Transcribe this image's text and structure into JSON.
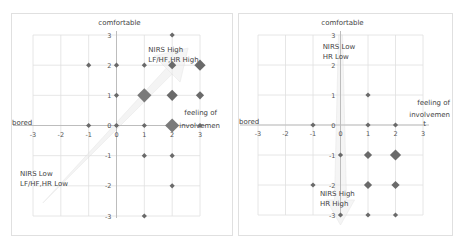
{
  "chart_data": [
    {
      "type": "scatter",
      "title": "",
      "xlabel": "feeling of involvemen t",
      "xlabel_negative": "bored",
      "ylabel": "comfortable",
      "xlim": [
        -3,
        3
      ],
      "ylim": [
        -3,
        3
      ],
      "x_ticks": [
        "-3",
        "-2",
        "-1",
        "0",
        "1",
        "2",
        "3"
      ],
      "y_ticks": [
        "3",
        "2",
        "1",
        "0",
        "-1",
        "-2",
        "-3"
      ],
      "grid": true,
      "annotations": [
        {
          "text": "NIRS High",
          "text2": "LF/HF,HR High",
          "region": "upper-right"
        },
        {
          "text": "NIRS Low",
          "text2": "LF/HF,HR Low",
          "region": "lower-left"
        }
      ],
      "trend_arrow": {
        "from": [
          -2.5,
          -2.5
        ],
        "to": [
          2.5,
          2.5
        ],
        "style": "faint wide arrow"
      },
      "points": [
        {
          "x": 2,
          "y": 3,
          "size": 1
        },
        {
          "x": -1,
          "y": 2,
          "size": 1
        },
        {
          "x": 0,
          "y": 2,
          "size": 1
        },
        {
          "x": 1,
          "y": 2,
          "size": 1
        },
        {
          "x": 2,
          "y": 2,
          "size": 2
        },
        {
          "x": 3,
          "y": 2,
          "size": 3
        },
        {
          "x": 0,
          "y": 1,
          "size": 1
        },
        {
          "x": 1,
          "y": 1,
          "size": 4
        },
        {
          "x": 2,
          "y": 1,
          "size": 3
        },
        {
          "x": 3,
          "y": 1,
          "size": 2
        },
        {
          "x": -1,
          "y": 0,
          "size": 1
        },
        {
          "x": 0,
          "y": 0,
          "size": 1
        },
        {
          "x": 1,
          "y": 0,
          "size": 1
        },
        {
          "x": 2,
          "y": 0,
          "size": 4
        },
        {
          "x": 3,
          "y": 0,
          "size": 1
        },
        {
          "x": 1,
          "y": -1,
          "size": 1
        },
        {
          "x": 2,
          "y": -1,
          "size": 1
        },
        {
          "x": 2,
          "y": -2,
          "size": 1
        },
        {
          "x": 1,
          "y": -3,
          "size": 1
        }
      ]
    },
    {
      "type": "scatter",
      "title": "",
      "xlabel": "feeling of involvemen t",
      "xlabel_negative": "bored",
      "ylabel": "comfortable",
      "xlim": [
        -3,
        3
      ],
      "ylim": [
        -3,
        3
      ],
      "x_ticks": [
        "-3",
        "-2",
        "-1",
        "0",
        "1",
        "2",
        "3"
      ],
      "y_ticks": [
        "3",
        "2",
        "1",
        "0",
        "-1",
        "-2",
        "-3"
      ],
      "grid": true,
      "annotations": [
        {
          "text": "NIRS Low",
          "text2": "HR Low",
          "region": "upper"
        },
        {
          "text": "NIRS High",
          "text2": "HR High",
          "region": "lower"
        }
      ],
      "trend_arrow": {
        "from": [
          0,
          3
        ],
        "to": [
          0,
          -3
        ],
        "style": "faint narrow arrow"
      },
      "points": [
        {
          "x": 1,
          "y": 1,
          "size": 1
        },
        {
          "x": -1,
          "y": 0,
          "size": 1
        },
        {
          "x": 1,
          "y": 0,
          "size": 1
        },
        {
          "x": 2,
          "y": 0,
          "size": 1
        },
        {
          "x": 0,
          "y": -1,
          "size": 1
        },
        {
          "x": 1,
          "y": -1,
          "size": 2
        },
        {
          "x": 2,
          "y": -1,
          "size": 3
        },
        {
          "x": -1,
          "y": -2,
          "size": 1
        },
        {
          "x": 1,
          "y": -2,
          "size": 2
        },
        {
          "x": 2,
          "y": -2,
          "size": 2
        },
        {
          "x": 0,
          "y": -3,
          "size": 1
        },
        {
          "x": 1,
          "y": -3,
          "size": 1
        },
        {
          "x": 2,
          "y": -3,
          "size": 1
        }
      ]
    }
  ],
  "colors": {
    "marker": "#6a6a6a",
    "grid": "#e0e0e0",
    "axis": "#bdbdbd",
    "text": "#444444",
    "arrow": "#d6d6d6"
  },
  "left": {
    "ylabel": "comfortable",
    "xlabel_pos_1": "feeling of",
    "xlabel_pos_2": "involvemen",
    "xlabel_neg": "bored",
    "ann_high_1": "NIRS High",
    "ann_high_2": "LF/HF,HR High",
    "ann_low_1": "NIRS Low",
    "ann_low_2": "LF/HF,HR Low"
  },
  "right": {
    "ylabel": "comfortable",
    "xlabel_pos_1": "feeling of",
    "xlabel_pos_2": "involvemen",
    "xlabel_pos_3": "t",
    "xlabel_neg": "bored",
    "ann_low_1": "NIRS Low",
    "ann_low_2": "HR Low",
    "ann_high_1": "NIRS High",
    "ann_high_2": "HR High"
  }
}
